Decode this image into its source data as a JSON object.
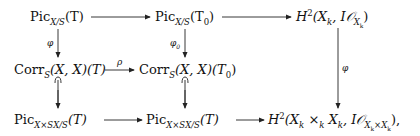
{
  "diagram": {
    "type": "commutative-diagram",
    "nodes": {
      "r1c1": {
        "base": "Pic",
        "sub": "X/S",
        "arg": "(T)"
      },
      "r1c2": {
        "base": "Pic",
        "sub": "X/S",
        "arg": "(T",
        "arg_sub": "0",
        "arg_end": ")"
      },
      "r1c3": {
        "base": "H",
        "sup": "2",
        "open": "(X",
        "sub1": "k",
        "mid": ", I𝒪",
        "sub2": "X",
        "sub2sub": "k",
        "close": ")"
      },
      "r2c1": {
        "base": "Corr",
        "sub": "S",
        "arg": "(X, X)(T)"
      },
      "r2c2": {
        "base": "Corr",
        "sub": "S",
        "arg": "(X, X)(T",
        "arg_sub": "0",
        "arg_end": ")"
      },
      "r3c1": {
        "base": "Pic",
        "sub": "X×SX/S",
        "arg": "(T)"
      },
      "r3c2": {
        "base": "Pic",
        "sub": "X×SX/S",
        "arg": "(T)"
      },
      "r3c3": {
        "text": "H²(X_k ×_k X_k, I𝒪_{X_k×X_k}),",
        "base": "H",
        "sup": "2",
        "open": "(X",
        "s1": "k",
        "t1": " ×",
        "s2": "k",
        "t2": " X",
        "s3": "k",
        "t3": ", I𝒪",
        "s4": "X",
        "s4b": "k",
        "s4c": "×X",
        "s4d": "k",
        "close": "),"
      }
    },
    "arrows": [
      {
        "from": "r1c1",
        "to": "r1c2",
        "label": ""
      },
      {
        "from": "r1c2",
        "to": "r1c3",
        "label": ""
      },
      {
        "from": "r1c1",
        "to": "r2c1",
        "label": "φ"
      },
      {
        "from": "r1c2",
        "to": "r2c2",
        "label": "φ₀"
      },
      {
        "from": "r2c1",
        "to": "r2c2",
        "label": "ρ"
      },
      {
        "from": "r1c3",
        "to": "r3c3",
        "label": "φ"
      },
      {
        "from": "r2c1",
        "to": "r3c1",
        "label": "",
        "style": "hook"
      },
      {
        "from": "r2c2",
        "to": "r3c2",
        "label": "",
        "style": "hook"
      },
      {
        "from": "r3c1",
        "to": "r3c2",
        "label": ""
      },
      {
        "from": "r3c2",
        "to": "r3c3",
        "label": ""
      }
    ],
    "labels": {
      "phi": "φ",
      "phi0": "φ",
      "phi0_sub": "0",
      "rho": "ρ",
      "phi_right": "φ"
    }
  }
}
